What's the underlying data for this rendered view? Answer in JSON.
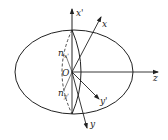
{
  "diagram": {
    "type": "ellipsoid-coordinate-axes",
    "origin_label": "O",
    "axes": [
      {
        "id": "x-prime",
        "label": "x'"
      },
      {
        "id": "x",
        "label": "x"
      },
      {
        "id": "z",
        "label": "z"
      },
      {
        "id": "y-prime",
        "label": "y'"
      },
      {
        "id": "y",
        "label": "y"
      }
    ],
    "annotations": [
      {
        "id": "n-x-prime",
        "base": "n",
        "sub": "x'"
      },
      {
        "id": "n-y-prime",
        "base": "n",
        "sub": "y'"
      }
    ],
    "colors": {
      "stroke": "#222222",
      "background": "#ffffff"
    }
  }
}
